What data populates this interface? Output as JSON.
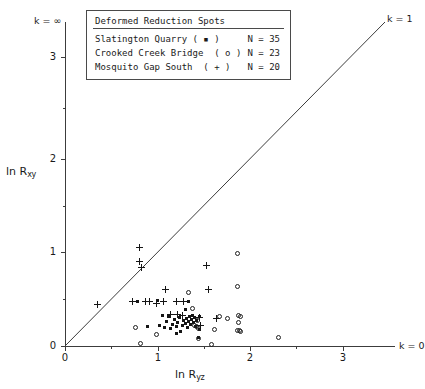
{
  "chart_data": {
    "type": "scatter",
    "title": "Deformed Reduction Spots",
    "xlabel": "ln Ryz",
    "ylabel": "ln Rxy",
    "xlim": [
      0,
      3.6
    ],
    "ylim": [
      0,
      3.5
    ],
    "xticks": [
      "0",
      "1",
      "2",
      "3"
    ],
    "xtick_values": [
      0,
      1,
      2,
      3
    ],
    "yticks": [
      "0",
      "1",
      "2",
      "3"
    ],
    "ytick_values": [
      0,
      1,
      2,
      3
    ],
    "grid": false,
    "legend_position": "top-center",
    "annotations": [
      {
        "name": "k-infinity",
        "text": "k = ∞",
        "at": "y-axis-top"
      },
      {
        "name": "k-one",
        "text": "k = 1",
        "at": "diagonal-end"
      },
      {
        "name": "k-zero",
        "text": "k = 0",
        "at": "x-axis-end"
      }
    ],
    "reference_line": {
      "name": "k = 1",
      "slope": 1,
      "intercept": 0
    },
    "series": [
      {
        "name": "Slatington Quarry",
        "marker": "filled-square",
        "marker_text": "( ▪ )",
        "n_label": "N = 35",
        "n": 35,
        "points": [
          [
            0.78,
            0.47
          ],
          [
            0.89,
            0.21
          ],
          [
            1.0,
            0.49
          ],
          [
            1.02,
            0.22
          ],
          [
            1.05,
            0.33
          ],
          [
            1.08,
            0.2
          ],
          [
            1.1,
            0.26
          ],
          [
            1.12,
            0.31
          ],
          [
            1.14,
            0.19
          ],
          [
            1.16,
            0.23
          ],
          [
            1.18,
            0.28
          ],
          [
            1.2,
            0.21
          ],
          [
            1.22,
            0.25
          ],
          [
            1.24,
            0.3
          ],
          [
            1.25,
            0.16
          ],
          [
            1.27,
            0.22
          ],
          [
            1.28,
            0.27
          ],
          [
            1.3,
            0.24
          ],
          [
            1.31,
            0.29
          ],
          [
            1.32,
            0.2
          ],
          [
            1.33,
            0.47
          ],
          [
            1.34,
            0.26
          ],
          [
            1.35,
            0.31
          ],
          [
            1.36,
            0.23
          ],
          [
            1.37,
            0.28
          ],
          [
            1.38,
            0.33
          ],
          [
            1.39,
            0.25
          ],
          [
            1.4,
            0.3
          ],
          [
            1.41,
            0.21
          ],
          [
            1.3,
            0.39
          ],
          [
            1.42,
            0.27
          ],
          [
            1.45,
            0.31
          ],
          [
            1.2,
            0.13
          ],
          [
            1.45,
            0.18
          ],
          [
            1.44,
            0.09
          ]
        ]
      },
      {
        "name": "Crooked Creek Bridge",
        "marker": "open-circle",
        "marker_text": "( o )",
        "n_label": "N = 23",
        "n": 23,
        "points": [
          [
            0.76,
            0.2
          ],
          [
            0.82,
            0.03
          ],
          [
            0.99,
            0.12
          ],
          [
            1.4,
            0.22
          ],
          [
            1.33,
            0.57
          ],
          [
            1.38,
            0.4
          ],
          [
            1.42,
            0.21
          ],
          [
            1.44,
            0.19
          ],
          [
            1.58,
            0.02
          ],
          [
            1.62,
            0.18
          ],
          [
            1.67,
            0.31
          ],
          [
            1.76,
            0.29
          ],
          [
            1.86,
            0.99
          ],
          [
            1.87,
            0.63
          ],
          [
            1.88,
            0.33
          ],
          [
            1.88,
            0.25
          ],
          [
            1.89,
            0.17
          ],
          [
            1.9,
            0.16
          ],
          [
            1.44,
            0.08
          ],
          [
            2.31,
            0.09
          ],
          [
            1.43,
            0.27
          ],
          [
            1.86,
            0.17
          ],
          [
            1.9,
            0.32
          ]
        ]
      },
      {
        "name": "Mosquito Gap South",
        "marker": "plus",
        "marker_text": "( + )",
        "n_label": "N = 20",
        "n": 20,
        "points": [
          [
            0.35,
            0.44
          ],
          [
            0.8,
            1.05
          ],
          [
            0.8,
            0.9
          ],
          [
            0.83,
            0.84
          ],
          [
            0.73,
            0.47
          ],
          [
            0.87,
            0.47
          ],
          [
            0.91,
            0.47
          ],
          [
            0.99,
            0.45
          ],
          [
            1.07,
            0.47
          ],
          [
            1.09,
            0.6
          ],
          [
            1.2,
            0.48
          ],
          [
            1.27,
            0.33
          ],
          [
            1.28,
            0.48
          ],
          [
            1.45,
            0.3
          ],
          [
            1.53,
            0.86
          ],
          [
            1.55,
            0.6
          ],
          [
            1.64,
            0.29
          ],
          [
            1.22,
            0.34
          ],
          [
            1.14,
            0.34
          ],
          [
            1.46,
            0.22
          ]
        ]
      }
    ]
  },
  "legend": {
    "title": "Deformed Reduction Spots",
    "rows": [
      {
        "label": "Slatington Quarry ( ▪ )",
        "count": "N = 35"
      },
      {
        "label": "Crooked Creek Bridge  ( o )",
        "count": "N = 23"
      },
      {
        "label": "Mosquito Gap South  ( + )",
        "count": "N = 20"
      }
    ]
  }
}
